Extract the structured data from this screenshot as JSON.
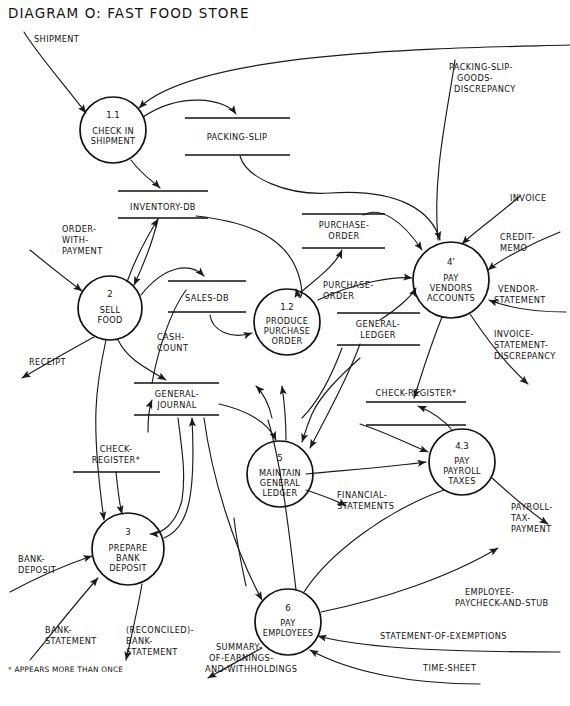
{
  "title": "DIAGRAM O: FAST FOOD STORE",
  "footnote": "* APPEARS MORE THAN ONCE",
  "processes": [
    {
      "id": "1.1",
      "number": "1.1",
      "name": [
        "CHECK IN",
        "SHIPMENT"
      ],
      "cx": 113,
      "cy": 130,
      "r": 33
    },
    {
      "id": "2",
      "number": "2",
      "name": [
        "SELL",
        "FOOD"
      ],
      "cx": 110,
      "cy": 308,
      "r": 32
    },
    {
      "id": "1.2",
      "number": "1.2",
      "name": [
        "PRODUCE",
        "PURCHASE",
        "ORDER"
      ],
      "cx": 287,
      "cy": 322,
      "r": 33
    },
    {
      "id": "4p",
      "number": "4'",
      "name": [
        "PAY",
        "VENDORS",
        "ACCOUNTS"
      ],
      "cx": 451,
      "cy": 280,
      "r": 38
    },
    {
      "id": "5",
      "number": "5",
      "name": [
        "MAINTAIN",
        "GENERAL",
        "LEDGER"
      ],
      "cx": 280,
      "cy": 474,
      "r": 33
    },
    {
      "id": "4.3",
      "number": "4.3",
      "name": [
        "PAY",
        "PAYROLL",
        "TAXES"
      ],
      "cx": 462,
      "cy": 462,
      "r": 33
    },
    {
      "id": "3",
      "number": "3",
      "name": [
        "PREPARE",
        "BANK",
        "DEPOSIT"
      ],
      "cx": 128,
      "cy": 549,
      "r": 36
    },
    {
      "id": "6",
      "number": "6",
      "name": [
        "PAY",
        "EMPLOYEES"
      ],
      "cx": 288,
      "cy": 622,
      "r": 33
    }
  ],
  "stores": [
    {
      "id": "packing-slip",
      "label": [
        "PACKING-SLIP"
      ],
      "x1": 185,
      "x2": 290,
      "yTop": 118,
      "yBot": 155,
      "textY": 140
    },
    {
      "id": "inventory-db",
      "label": [
        "INVENTORY-DB"
      ],
      "x1": 118,
      "x2": 208,
      "yTop": 191,
      "yBot": 218,
      "textY": 210
    },
    {
      "id": "sales-db",
      "label": [
        "SALES-DB"
      ],
      "x1": 168,
      "x2": 246,
      "yTop": 281,
      "yBot": 312,
      "textY": 301
    },
    {
      "id": "purchase-order",
      "label": [
        "PURCHASE-",
        "ORDER"
      ],
      "x1": 302,
      "x2": 385,
      "yTop": 214,
      "yBot": 248,
      "textY": 229
    },
    {
      "id": "general-ledger",
      "label": [
        "GENERAL-",
        "LEDGER"
      ],
      "x1": 337,
      "x2": 420,
      "yTop": 313,
      "yBot": 345,
      "textY": 328
    },
    {
      "id": "general-journal",
      "label": [
        "GENERAL-",
        "JOURNAL"
      ],
      "x1": 134,
      "x2": 219,
      "yTop": 383,
      "yBot": 415,
      "textY": 398
    },
    {
      "id": "check-register-a",
      "label": [
        "CHECK-REGISTER*"
      ],
      "x1": 366,
      "x2": 466,
      "yTop": 402,
      "yBot": 425,
      "textY": 396,
      "labelAbove": true
    },
    {
      "id": "check-register-b",
      "label": [
        "CHECK-",
        "REGISTER*"
      ],
      "x1": 73,
      "x2": 160,
      "yTop": 472,
      "yBot": 472,
      "textY": 456,
      "labelAbove": true,
      "singleLine": true
    }
  ],
  "flows": [
    {
      "id": "shipment",
      "label": [
        "SHIPMENT"
      ],
      "lx": 34,
      "ly": 42
    },
    {
      "id": "packing-slip-goods-disc",
      "label": [
        "PACKING-SLIP-",
        "GOODS-",
        "DISCREPANCY"
      ],
      "lx": 449,
      "ly": 70
    },
    {
      "id": "order-with-payment",
      "label": [
        "ORDER-",
        "WITH-",
        "PAYMENT"
      ],
      "lx": 62,
      "ly": 232
    },
    {
      "id": "receipt",
      "label": [
        "RECEIPT"
      ],
      "lx": 29,
      "ly": 365
    },
    {
      "id": "cash-count",
      "label": [
        "CASH-",
        "COUNT"
      ],
      "lx": 157,
      "ly": 340
    },
    {
      "id": "purchase-order-flow",
      "label": [
        "PURCHASE-",
        "ORDER"
      ],
      "lx": 323,
      "ly": 288
    },
    {
      "id": "invoice",
      "label": [
        "INVOICE"
      ],
      "lx": 510,
      "ly": 201
    },
    {
      "id": "credit-memo",
      "label": [
        "CREDIT-",
        "MEMO"
      ],
      "lx": 500,
      "ly": 240
    },
    {
      "id": "vendor-statement",
      "label": [
        "VENDOR-",
        "STATEMENT"
      ],
      "lx": 498,
      "ly": 292
    },
    {
      "id": "invoice-statement-disc",
      "label": [
        "INVOICE-",
        "STATEMENT-",
        "DISCREPANCY"
      ],
      "lx": 494,
      "ly": 337
    },
    {
      "id": "financial-statements",
      "label": [
        "FINANCIAL-",
        "STATEMENTS"
      ],
      "lx": 337,
      "ly": 498
    },
    {
      "id": "payroll-tax-payment",
      "label": [
        "PAYROLL-",
        "TAX-",
        "PAYMENT"
      ],
      "lx": 511,
      "ly": 510
    },
    {
      "id": "bank-deposit",
      "label": [
        "BANK-",
        "DEPOSIT"
      ],
      "lx": 18,
      "ly": 562
    },
    {
      "id": "bank-statement",
      "label": [
        "BANK-",
        "STATEMENT"
      ],
      "lx": 45,
      "ly": 633
    },
    {
      "id": "reconciled-bank-statement",
      "label": [
        "(RECONCILED)-",
        "BANK-",
        "STATEMENT"
      ],
      "lx": 126,
      "ly": 633
    },
    {
      "id": "employee-paycheck-stub",
      "label": [
        "EMPLOYEE-",
        "PAYCHECK-AND-STUB"
      ],
      "lx": 465,
      "ly": 595
    },
    {
      "id": "statement-of-exemptions",
      "label": [
        "STATEMENT-OF-EXEMPTIONS"
      ],
      "lx": 380,
      "ly": 639
    },
    {
      "id": "time-sheet",
      "label": [
        "TIME-SHEET"
      ],
      "lx": 423,
      "ly": 671
    },
    {
      "id": "summary-earnings-withhold",
      "label": [
        "SUMMARY-",
        "OF-EARNINGS-",
        "AND-WITHHOLDINGS"
      ],
      "lx": 216,
      "ly": 650
    }
  ],
  "colors": {
    "ink": "#111111",
    "background": "#ffffff"
  }
}
